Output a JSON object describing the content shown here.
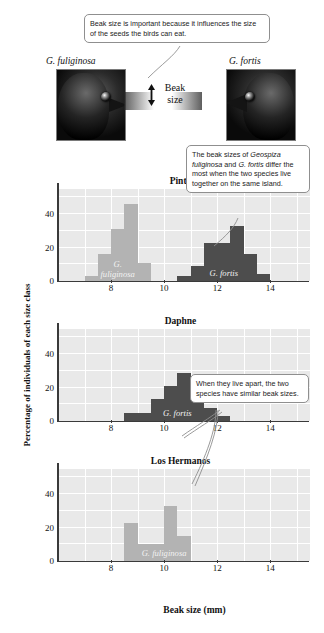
{
  "figure": {
    "x_axis_title": "Beak size (mm)",
    "y_axis_title": "Percentage of individuals of each size class"
  },
  "illustration": {
    "left_species": "G. fuliginosa",
    "right_species": "G. fortis",
    "beak_label_line1": "Beak",
    "beak_label_line2": "size",
    "left_bird_icon": "finch-head-small-beak-icon",
    "right_bird_icon": "finch-head-large-beak-icon",
    "arrow_icon": "double-headed-vertical-arrow-icon"
  },
  "callouts": [
    {
      "id": "top",
      "text": "Beak size is important because it influences the size of the seeds the birds can eat."
    },
    {
      "id": "pinta",
      "text_parts": [
        {
          "text": "The beak sizes of ",
          "italic": false
        },
        {
          "text": "Geospiza fuliginosa",
          "italic": true
        },
        {
          "text": " and ",
          "italic": false
        },
        {
          "text": "G. fortis",
          "italic": true
        },
        {
          "text": " differ the most when the two species live together on the same island.",
          "italic": false
        }
      ]
    },
    {
      "id": "daphne",
      "text": "When they live apart, the two species have similar beak sizes."
    }
  ],
  "chart_data": [
    {
      "type": "bar",
      "title": "Pinta",
      "xlabel": "Beak size (mm)",
      "ylabel": "Percentage of individuals of each size class",
      "xlim": [
        6.0,
        15.5
      ],
      "ylim": [
        0,
        55
      ],
      "yticks": [
        0,
        20,
        40
      ],
      "xticks": [
        8,
        10,
        12,
        14
      ],
      "grid": true,
      "bin_width": 0.5,
      "series": [
        {
          "name": "G. fuliginosa",
          "color": "#b3b3b3",
          "bins": [
            7.0,
            7.5,
            8.0,
            8.5,
            9.0
          ],
          "values": [
            3,
            16,
            31,
            46,
            11
          ]
        },
        {
          "name": "G. fortis",
          "color": "#4d4d4d",
          "bins": [
            10.5,
            11.0,
            11.5,
            12.0,
            12.5,
            13.0,
            13.5
          ],
          "values": [
            3,
            9,
            23,
            23,
            33,
            16,
            4
          ]
        }
      ]
    },
    {
      "type": "bar",
      "title": "Daphne",
      "xlabel": "Beak size (mm)",
      "ylabel": "Percentage of individuals of each size class",
      "xlim": [
        6.0,
        15.5
      ],
      "ylim": [
        0,
        55
      ],
      "yticks": [
        0,
        20,
        40
      ],
      "xticks": [
        8,
        10,
        12,
        14
      ],
      "grid": true,
      "bin_width": 0.5,
      "series": [
        {
          "name": "G. fortis",
          "color": "#4d4d4d",
          "bins": [
            8.5,
            9.0,
            9.5,
            10.0,
            10.5,
            11.0,
            11.5,
            12.0
          ],
          "values": [
            5,
            5,
            13,
            21,
            29,
            16,
            8,
            3
          ]
        }
      ]
    },
    {
      "type": "bar",
      "title": "Los Hermanos",
      "xlabel": "Beak size (mm)",
      "ylabel": "Percentage of individuals of each size class",
      "xlim": [
        6.0,
        15.5
      ],
      "ylim": [
        0,
        55
      ],
      "yticks": [
        0,
        20,
        40
      ],
      "xticks": [
        8,
        10,
        12,
        14
      ],
      "grid": true,
      "bin_width": 0.5,
      "series": [
        {
          "name": "G. fuliginosa",
          "color": "#b3b3b3",
          "bins": [
            8.5,
            9.0,
            9.5,
            10.0,
            10.5,
            11.0
          ],
          "values": [
            23,
            10,
            10,
            33,
            15,
            0
          ]
        }
      ]
    }
  ]
}
